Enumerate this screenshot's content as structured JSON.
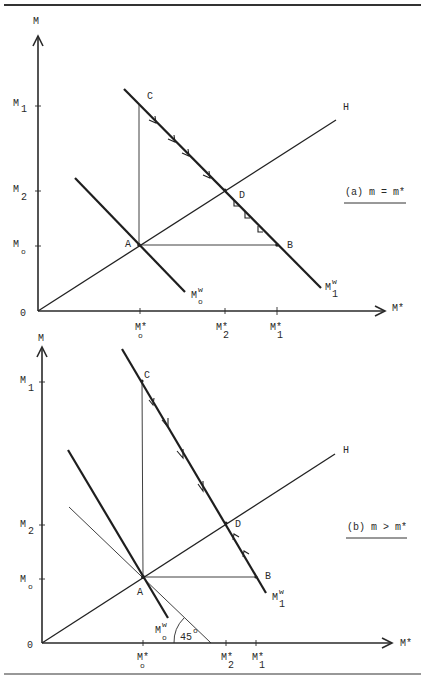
{
  "panel_a": {
    "y_axis_label": "M",
    "x_axis_label": "M*",
    "origin_label": "0",
    "y_ticks": [
      {
        "main": "M",
        "sub": "1"
      },
      {
        "main": "M",
        "sub": "2"
      },
      {
        "main": "M",
        "sub": "o"
      }
    ],
    "x_ticks": [
      {
        "main": "M*",
        "sub": "o"
      },
      {
        "main": "M*",
        "sub": "2"
      },
      {
        "main": "M*",
        "sub": "1"
      }
    ],
    "points": {
      "A": "A",
      "B": "B",
      "C": "C",
      "D": "D"
    },
    "line_H": "H",
    "curve_M0w": {
      "main": "M",
      "sub": "o",
      "sup": "w"
    },
    "curve_M1w": {
      "main": "M",
      "sub": "1",
      "sup": "w"
    },
    "caption": "(a) m = m*"
  },
  "panel_b": {
    "y_axis_label": "M",
    "x_axis_label": "M*",
    "origin_label": "0",
    "y_ticks": [
      {
        "main": "M",
        "sub": "1"
      },
      {
        "main": "M",
        "sub": "2"
      },
      {
        "main": "M",
        "sub": "o"
      }
    ],
    "x_ticks": [
      {
        "main": "M*",
        "sub": "o"
      },
      {
        "main": "M*",
        "sub": "2"
      },
      {
        "main": "M*",
        "sub": "1"
      }
    ],
    "points": {
      "A": "A",
      "B": "B",
      "C": "C",
      "D": "D"
    },
    "line_H": "H",
    "curve_M0w": {
      "main": "M",
      "sub": "o",
      "sup": "w"
    },
    "curve_M1w": {
      "main": "M",
      "sub": "1",
      "sup": "w"
    },
    "angle_label": "45",
    "angle_degree": "o",
    "caption": "(b) m > m*"
  }
}
